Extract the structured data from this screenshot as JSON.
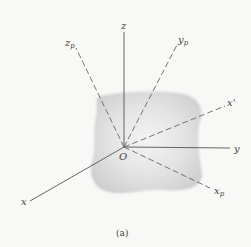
{
  "figure": {
    "caption": "(a)",
    "origin_label": "O",
    "axes": {
      "x": {
        "label": "x",
        "sub": "",
        "style": "solid"
      },
      "y": {
        "label": "y",
        "sub": "",
        "style": "solid"
      },
      "z": {
        "label": "z",
        "sub": "",
        "style": "solid"
      },
      "xp": {
        "label": "x",
        "sub": "p",
        "style": "dashed"
      },
      "yp": {
        "label": "y",
        "sub": "p",
        "style": "dashed"
      },
      "zp": {
        "label": "z",
        "sub": "p",
        "style": "dashed"
      },
      "xprime": {
        "label": "x'",
        "sub": "",
        "style": "dashed"
      }
    },
    "colors": {
      "background": "#f8f8f6",
      "line": "#555555",
      "body": "#d9d9d9"
    }
  }
}
